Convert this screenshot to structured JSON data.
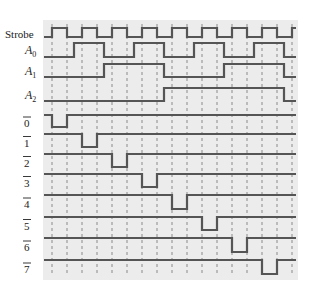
{
  "colors": {
    "background": "#ffffff",
    "panel": "#ececec",
    "signal": "#555555",
    "gridline": "#8a8a8a",
    "label": "#222222"
  },
  "grid": {
    "panel": {
      "x": 43,
      "y": 20,
      "width": 255,
      "height": 260
    },
    "tick_x": [
      52,
      67,
      82,
      97,
      112,
      127,
      142,
      157,
      172,
      187,
      202,
      217,
      232,
      247,
      262,
      277,
      292
    ],
    "x_start": 44,
    "x_end": 296
  },
  "signals": [
    {
      "name": "Strobe",
      "label": "Strobe",
      "sub": "",
      "overline": false,
      "y_high": 28,
      "y_low": 37,
      "initial": 0,
      "transitions": [
        52,
        67,
        82,
        97,
        112,
        127,
        142,
        157,
        172,
        187,
        202,
        217,
        232,
        247,
        262,
        277,
        292
      ]
    },
    {
      "name": "A0",
      "label": "A",
      "sub": "0",
      "overline": false,
      "y_high": 43,
      "y_low": 57,
      "initial": 0,
      "transitions": [
        74,
        104,
        134,
        164,
        194,
        224,
        254,
        284
      ]
    },
    {
      "name": "A1",
      "label": "A",
      "sub": "1",
      "overline": false,
      "y_high": 64,
      "y_low": 77,
      "initial": 0,
      "transitions": [
        104,
        164,
        224,
        284
      ]
    },
    {
      "name": "A2",
      "label": "A",
      "sub": "2",
      "overline": false,
      "y_high": 88,
      "y_low": 101,
      "initial": 0,
      "transitions": [
        164,
        284
      ]
    },
    {
      "name": "out0",
      "label": "0",
      "sub": "",
      "overline": true,
      "y_high": 115,
      "y_low": 127,
      "initial": 1,
      "transitions": [
        52,
        67
      ]
    },
    {
      "name": "out1",
      "label": "1",
      "sub": "",
      "overline": true,
      "y_high": 134,
      "y_low": 147,
      "initial": 1,
      "transitions": [
        82,
        97
      ]
    },
    {
      "name": "out2",
      "label": "2",
      "sub": "",
      "overline": true,
      "y_high": 154,
      "y_low": 167,
      "initial": 1,
      "transitions": [
        112,
        127
      ]
    },
    {
      "name": "out3",
      "label": "3",
      "sub": "",
      "overline": true,
      "y_high": 174,
      "y_low": 187,
      "initial": 1,
      "transitions": [
        142,
        157
      ]
    },
    {
      "name": "out4",
      "label": "4",
      "sub": "",
      "overline": true,
      "y_high": 195,
      "y_low": 209,
      "initial": 1,
      "transitions": [
        172,
        187
      ]
    },
    {
      "name": "out5",
      "label": "5",
      "sub": "",
      "overline": true,
      "y_high": 217,
      "y_low": 230,
      "initial": 1,
      "transitions": [
        202,
        217
      ]
    },
    {
      "name": "out6",
      "label": "6",
      "sub": "",
      "overline": true,
      "y_high": 238,
      "y_low": 252,
      "initial": 1,
      "transitions": [
        232,
        247
      ]
    },
    {
      "name": "out7",
      "label": "7",
      "sub": "",
      "overline": true,
      "y_high": 260,
      "y_low": 274,
      "initial": 1,
      "transitions": [
        262,
        277
      ]
    }
  ]
}
